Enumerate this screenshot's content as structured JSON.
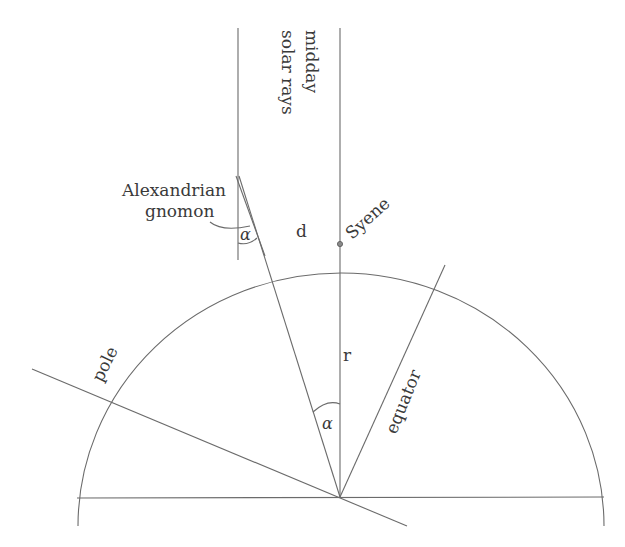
{
  "diagram": {
    "labels": {
      "rays_line1": "midday",
      "rays_line2": "solar rays",
      "gnomon_line1": "Alexandrian",
      "gnomon_line2": "gnomon",
      "alpha_top": "α",
      "alpha_center": "α",
      "arc_distance": "d",
      "syene": "Syene",
      "radius": "r",
      "pole": "pole",
      "equator": "equator"
    },
    "colors": {
      "line": "#6b6b6b",
      "text": "#3a3a3a",
      "background": "#ffffff"
    }
  }
}
